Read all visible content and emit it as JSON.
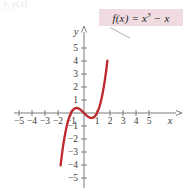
{
  "figure": {
    "top_cut_label": "y, y(x)",
    "formula_label": "f(x) = x",
    "formula_exponent": "3",
    "formula_tail": " − x",
    "axis_x_name": "x",
    "axis_y_name": "y",
    "colors": {
      "curve": "#c0272d",
      "axis": "#6d6d6d",
      "label_box_bg": "#f0dbe0",
      "leader_line": "#9a9a9a",
      "tick_text": "#3a3a3a"
    }
  },
  "chart_data": {
    "type": "line",
    "title": "",
    "subtitle": "",
    "xlabel": "x",
    "ylabel": "y",
    "xlim": [
      -5.9,
      6.0
    ],
    "ylim": [
      -5.9,
      5.9
    ],
    "grid": false,
    "legend_position": "callout-top-right",
    "annotations": [
      {
        "text": "f(x) = x^3 - x",
        "style": "boxed-callout",
        "points_to": [
          1.78,
          4.9
        ]
      }
    ],
    "xticks": [
      -5,
      -4,
      -3,
      -2,
      -1,
      1,
      2,
      3,
      4,
      5
    ],
    "xtick_labels": [
      "−5",
      "−4",
      "−3",
      "−2",
      "−1",
      "1",
      "2",
      "3",
      "4",
      "5"
    ],
    "yticks": [
      -5,
      -4,
      -3,
      -2,
      -1,
      1,
      2,
      3,
      4,
      5
    ],
    "ytick_labels": [
      "−5",
      "−4",
      "−3",
      "−2",
      "−1",
      "1",
      "2",
      "3",
      "4",
      "5"
    ],
    "series": [
      {
        "name": "f(x) = x^3 - x",
        "color": "#c0272d",
        "x": [
          -1.8,
          -1.75,
          -1.7,
          -1.65,
          -1.6,
          -1.55,
          -1.5,
          -1.45,
          -1.4,
          -1.35,
          -1.3,
          -1.25,
          -1.2,
          -1.15,
          -1.1,
          -1.05,
          -1.0,
          -0.95,
          -0.9,
          -0.85,
          -0.8,
          -0.75,
          -0.7,
          -0.65,
          -0.6,
          -0.5774,
          -0.55,
          -0.5,
          -0.45,
          -0.4,
          -0.35,
          -0.3,
          -0.25,
          -0.2,
          -0.15,
          -0.1,
          -0.05,
          0.0,
          0.05,
          0.1,
          0.15,
          0.2,
          0.25,
          0.3,
          0.35,
          0.4,
          0.45,
          0.5,
          0.55,
          0.5774,
          0.6,
          0.65,
          0.7,
          0.75,
          0.8,
          0.85,
          0.9,
          0.95,
          1.0,
          1.05,
          1.1,
          1.15,
          1.2,
          1.25,
          1.3,
          1.35,
          1.4,
          1.45,
          1.5,
          1.55,
          1.6,
          1.65,
          1.7,
          1.75,
          1.8
        ],
        "y": [
          -4.032,
          -3.609,
          -3.213,
          -2.843,
          -2.496,
          -2.174,
          -1.875,
          -1.599,
          -1.344,
          -1.111,
          -0.897,
          -0.703,
          -0.528,
          -0.371,
          -0.231,
          -0.108,
          0.0,
          0.093,
          0.171,
          0.236,
          0.288,
          0.328,
          0.357,
          0.375,
          0.384,
          0.3849,
          0.384,
          0.375,
          0.359,
          0.336,
          0.307,
          0.273,
          0.234,
          0.192,
          0.147,
          0.099,
          0.05,
          0.0,
          -0.05,
          -0.099,
          -0.147,
          -0.192,
          -0.234,
          -0.273,
          -0.307,
          -0.336,
          -0.359,
          -0.375,
          -0.384,
          -0.3849,
          -0.384,
          -0.375,
          -0.357,
          -0.328,
          -0.288,
          -0.236,
          -0.171,
          -0.093,
          0.0,
          0.107,
          0.231,
          0.371,
          0.528,
          0.703,
          0.897,
          1.111,
          1.344,
          1.599,
          1.875,
          2.174,
          2.496,
          2.843,
          3.213,
          3.609,
          4.032
        ]
      }
    ],
    "notable_points": {
      "roots": [
        -1,
        0,
        1
      ],
      "local_max": {
        "x": -0.5774,
        "y": 0.3849
      },
      "local_min": {
        "x": 0.5774,
        "y": -0.3849
      },
      "inflection": {
        "x": 0,
        "y": 0
      }
    },
    "curve_visible_range": {
      "x_start": -1.8,
      "x_end": 1.8,
      "y_start": -5.5,
      "y_end": 5.0
    }
  }
}
